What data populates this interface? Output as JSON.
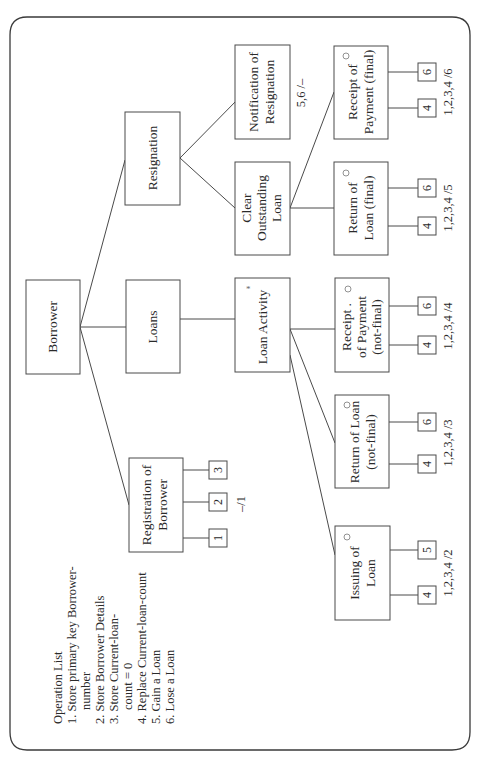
{
  "diagram": {
    "orientation": "rotated-90-ccw",
    "root": {
      "label": "Borrower"
    },
    "level1": [
      {
        "id": "registration",
        "lines": [
          "Registration of",
          "Borrower"
        ],
        "ops": [
          "1",
          "2",
          "3"
        ],
        "op_note": "–/1"
      },
      {
        "id": "loans",
        "lines": [
          "Loans"
        ]
      },
      {
        "id": "resignation",
        "lines": [
          "Resignation"
        ]
      }
    ],
    "level2": [
      {
        "id": "loan-activity",
        "lines": [
          "Loan Activity"
        ],
        "marker": "*"
      },
      {
        "id": "clear-outstanding",
        "lines": [
          "Clear",
          "Outstanding",
          "Loan"
        ]
      },
      {
        "id": "notification",
        "lines": [
          "Notification of",
          "Resignation"
        ],
        "op_note": "5,6 /–"
      }
    ],
    "level3": [
      {
        "id": "issuing",
        "lines": [
          "Issuing of",
          "Loan"
        ],
        "marker": "○",
        "ops": [
          "4",
          "5"
        ],
        "op_note": "1,2,3,4 /2"
      },
      {
        "id": "return-notfinal",
        "lines": [
          "Return of Loan",
          "(not-final)"
        ],
        "marker": "○",
        "ops": [
          "4",
          "6"
        ],
        "op_note": "1,2,3,4 /3"
      },
      {
        "id": "receipt-notfinal",
        "lines": [
          "Receipt .",
          "of Payment",
          "(not-final)"
        ],
        "marker": "○",
        "ops": [
          "4",
          "6"
        ],
        "op_note": "1,2,3,4 /4"
      },
      {
        "id": "return-final",
        "lines": [
          "Return of",
          "Loan (final)"
        ],
        "marker": "○",
        "ops": [
          "4",
          "6"
        ],
        "op_note": "1,2,3,4 /5"
      },
      {
        "id": "receipt-final",
        "lines": [
          "Receipt of",
          "Payment (final)"
        ],
        "marker": "○",
        "ops": [
          "4",
          "6"
        ],
        "op_note": "1,2,3,4 /6"
      }
    ]
  },
  "operation_list": {
    "title": "Operation List",
    "lines": [
      "1. Store primary key Borrower-",
      "    number",
      "2. Store Borrower Details",
      "3. Store Current-loan-",
      "    count = 0",
      "4. Replace Current-loan-count",
      "5. Gain a Loan",
      "6. Lose a Loan"
    ]
  }
}
